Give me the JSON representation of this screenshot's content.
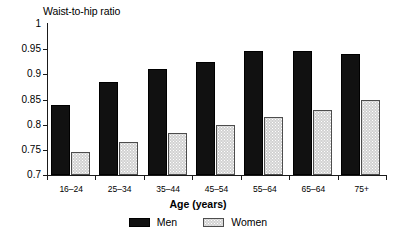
{
  "chart_data": {
    "type": "bar",
    "title": "Waist-to-hip ratio",
    "xlabel": "Age (years)",
    "ylabel": "",
    "categories": [
      "16–24",
      "25–34",
      "35–44",
      "45–54",
      "55–64",
      "65–64",
      "75+"
    ],
    "series": [
      {
        "name": "Men",
        "color": "#111111",
        "values": [
          0.84,
          0.884,
          0.91,
          0.925,
          0.947,
          0.947,
          0.941
        ]
      },
      {
        "name": "Women",
        "color": "#d2d2d2",
        "values": [
          0.745,
          0.765,
          0.784,
          0.8,
          0.815,
          0.83,
          0.85
        ]
      }
    ],
    "ylim": [
      0.7,
      1.0
    ],
    "yticks": [
      0.7,
      0.75,
      0.8,
      0.85,
      0.9,
      0.95,
      1.0
    ],
    "ytick_labels": [
      "0.7",
      "0.75",
      "0.8",
      "0.85",
      "0.9",
      "0.95",
      "1"
    ],
    "grid": false,
    "legend_position": "bottom-center"
  }
}
